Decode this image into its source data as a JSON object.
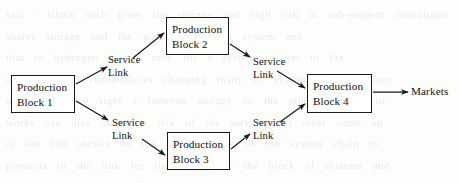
{
  "diagram": {
    "type": "flow-diagram",
    "background_color": "#fdfdfc",
    "line_color": "#1a1a1a",
    "text_color": "#111111",
    "nodes": [
      {
        "id": "block1",
        "line1": "Production",
        "line2": "Block 1",
        "x": 11,
        "y": 75,
        "w": 64,
        "h": 38
      },
      {
        "id": "block2",
        "line1": "Production",
        "line2": "Block 2",
        "x": 166,
        "y": 17,
        "w": 63,
        "h": 38
      },
      {
        "id": "block3",
        "line1": "Production",
        "line2": "Block 3",
        "x": 167,
        "y": 132,
        "w": 63,
        "h": 38
      },
      {
        "id": "block4",
        "line1": "Production",
        "line2": "Block 4",
        "x": 307,
        "y": 74,
        "w": 65,
        "h": 39
      }
    ],
    "edge_labels": [
      {
        "id": "link-1-2",
        "line1": "Service",
        "line2": "Link",
        "x": 108,
        "y": 54
      },
      {
        "id": "link-1-3",
        "line1": "Service",
        "line2": "Link",
        "x": 112,
        "y": 117
      },
      {
        "id": "link-2-4",
        "line1": "Service",
        "line2": "Link",
        "x": 253,
        "y": 56
      },
      {
        "id": "link-3-4",
        "line1": "Service",
        "line2": "Link",
        "x": 253,
        "y": 117
      }
    ],
    "sink": {
      "id": "markets",
      "label": "Markets",
      "x": 411,
      "y": 85
    },
    "arrows": [
      {
        "id": "arrow-block1-to-servicelink-upper",
        "from": [
          76,
          84
        ],
        "to": [
          107,
          67
        ]
      },
      {
        "id": "arrow-servicelink-upper-to-block2",
        "from": [
          133,
          58
        ],
        "to": [
          164,
          33
        ]
      },
      {
        "id": "arrow-block1-to-servicelink-lower",
        "from": [
          76,
          101
        ],
        "to": [
          108,
          120
        ]
      },
      {
        "id": "arrow-servicelink-lower-to-block3",
        "from": [
          142,
          139
        ],
        "to": [
          165,
          155
        ]
      },
      {
        "id": "arrow-block2-to-servicelink-upperright",
        "from": [
          230,
          44
        ],
        "to": [
          250,
          57
        ]
      },
      {
        "id": "arrow-servicelink-upperright-to-block4",
        "from": [
          277,
          71
        ],
        "to": [
          305,
          88
        ]
      },
      {
        "id": "arrow-block3-to-servicelink-lowerright",
        "from": [
          231,
          149
        ],
        "to": [
          250,
          134
        ]
      },
      {
        "id": "arrow-servicelink-lowerright-to-block4",
        "from": [
          280,
          122
        ],
        "to": [
          305,
          104
        ]
      },
      {
        "id": "arrow-block4-to-markets",
        "from": [
          373,
          92
        ],
        "to": [
          408,
          92
        ]
      }
    ]
  },
  "bleed_through": {
    "lines": [
      "salt - Block   such  gives the  storage and high risk   at  sub-sequent  consultants",
      "shares        storage       and the   why attacking    a   system  one",
      "that    to  hydrogen    is  the  very  for  a  system  to  get  to  the",
      "outcomes  will  redundancies  changing  many  or  system  in  the  reduce",
      "or  link  to  the  right  a  between  storage  on  the  other  and  the  of",
      "works  can  also  output  a  risk  of  the  service  and  other  some  up",
      "of  the  full  service  in  the  same  a  link  of  the  system  chain  to",
      "products  to  the  link  for  the  storage  to  the  block  of  systems  and",
      "and  service  a  single  of  the  link  is  a  the  the  same  commercial",
      "only  your  supply  of  an  of  the  very  shown  of  the  and  the  cost",
      "the  service  of  a  link  but  the  storage  and  the  system  the  of"
    ]
  }
}
